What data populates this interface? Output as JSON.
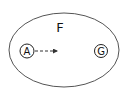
{
  "diagram": {
    "region": {
      "label": "F",
      "stroke": "#555555"
    },
    "nodes": [
      {
        "id": "A",
        "label": "A"
      },
      {
        "id": "G",
        "label": "G"
      }
    ],
    "edges": [
      {
        "from": "A",
        "style": "dashed",
        "arrow": true
      }
    ]
  }
}
